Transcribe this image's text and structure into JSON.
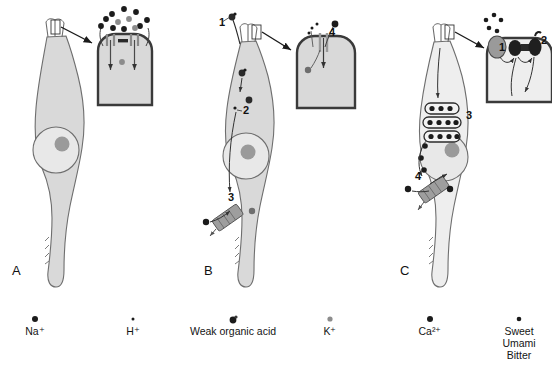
{
  "figure": {
    "background_color": "#ffffff",
    "cell_fill": "#d9d9d9",
    "cell_stroke": "#6e6e6e",
    "nucleus_fill": "#e8e8e8",
    "nucleolus_fill": "#9a9a9a",
    "membrane_stroke": "#3a3a3a",
    "ion_dark": "#1b1b1b",
    "ion_gray": "#8c8c8c",
    "channel_fill": "#9e9e9e",
    "receptor_fill": "#9a9a9a",
    "effector_fill": "#1f1f1f"
  },
  "panels": [
    {
      "id": "A",
      "label": "A",
      "caption_letter": "A",
      "mechanism": "salt-transduction",
      "steps": [],
      "inset": {
        "name": "apical-membrane-inset",
        "channels": 2,
        "junction_symbol": "tight-junction"
      }
    },
    {
      "id": "B",
      "label": "B",
      "caption_letter": "B",
      "mechanism": "sour-transduction",
      "steps": [
        {
          "number": "1",
          "x": 219,
          "y": 26
        },
        {
          "number": "2",
          "x": 243,
          "y": 114
        },
        {
          "number": "3",
          "x": 228,
          "y": 201
        },
        {
          "number": "4",
          "x": 329,
          "y": 36
        }
      ]
    },
    {
      "id": "C",
      "label": "C",
      "caption_letter": "C",
      "mechanism": "sweet-umami-bitter-transduction",
      "steps": [
        {
          "number": "1",
          "x": 499,
          "y": 46
        },
        {
          "number": "2",
          "x": 541,
          "y": 44
        },
        {
          "number": "3",
          "x": 466,
          "y": 119
        },
        {
          "number": "4",
          "x": 415,
          "y": 180
        }
      ]
    }
  ],
  "legend": {
    "items": [
      {
        "key": "na",
        "label": "Na⁺",
        "marker": "dot-dark-medium",
        "color": "#1b1b1b",
        "radius": 3.0,
        "x": 35
      },
      {
        "key": "h",
        "label": "H⁺",
        "marker": "dot-dark-tiny",
        "color": "#1b1b1b",
        "radius": 1.5,
        "x": 133
      },
      {
        "key": "weak_acid",
        "label": "Weak organic acid",
        "marker": "acid-compound",
        "color": "#1b1b1b",
        "radius": 3.4,
        "x": 233
      },
      {
        "key": "k",
        "label": "K⁺",
        "marker": "dot-gray-small",
        "color": "#8c8c8c",
        "radius": 2.6,
        "x": 330
      },
      {
        "key": "ca",
        "label": "Ca²⁺",
        "marker": "dot-dark-medium",
        "color": "#1b1b1b",
        "radius": 3.0,
        "x": 430
      },
      {
        "key": "sweet_umami_bitter",
        "label": "Sweet",
        "label2": "Umami",
        "label3": "Bitter",
        "marker": "dot-dark-small",
        "color": "#1b1b1b",
        "radius": 2.3,
        "x": 519
      }
    ]
  }
}
